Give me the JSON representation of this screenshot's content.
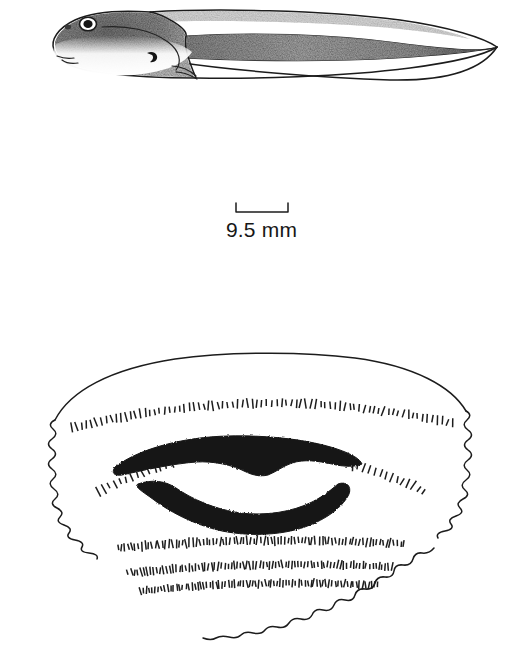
{
  "figure": {
    "panels": [
      {
        "id": "lateral-view",
        "name": "lateral view of tadpole"
      },
      {
        "id": "scale-bar",
        "name": "scale bar"
      },
      {
        "id": "oral-disc",
        "name": "oral disc"
      }
    ]
  },
  "scale_bar": {
    "label": "9.5 mm",
    "value": 9.5,
    "unit": "mm",
    "bar_length_px": 52,
    "tick_style": "downward-end-ticks"
  },
  "colors": {
    "ink": "#1c1c1c",
    "jaw_sheath": "#151515",
    "pigment_dark": "#6f6f6f",
    "pigment_mid": "#9a9a9a",
    "pigment_light": "#c9c9c9",
    "background": "#ffffff"
  },
  "lateral_view": {
    "parts": [
      "body",
      "tail-musculature",
      "dorsal-fin",
      "ventral-fin",
      "eye",
      "nostril",
      "oral-disc-marker",
      "spiracle",
      "vent-tube"
    ],
    "pigmentation": "dense dark stippling over dorsum and body, pale unpigmented belly, pigment extending along tail musculature and fading toward pointed tail tip",
    "tail_tip": "pointed"
  },
  "oral_disc": {
    "marginal_papillae": "scalloped border on lateral and ventral margins; wide dorsal gap with smooth margin",
    "jaw_sheaths": [
      {
        "name": "upper-jaw-sheath",
        "shape": "broad arch with medial downward projection"
      },
      {
        "name": "lower-jaw-sheath",
        "shape": "V-shaped / U-shaped"
      }
    ],
    "labial_tooth_row_formula": "2(2)/3",
    "tooth_rows": [
      {
        "id": "A-1",
        "position": "anterior",
        "interrupted": false
      },
      {
        "id": "A-2",
        "position": "anterior",
        "interrupted": true
      },
      {
        "id": "P-1",
        "position": "posterior",
        "interrupted": false
      },
      {
        "id": "P-2",
        "position": "posterior",
        "interrupted": false
      },
      {
        "id": "P-3",
        "position": "posterior",
        "interrupted": false
      }
    ]
  }
}
